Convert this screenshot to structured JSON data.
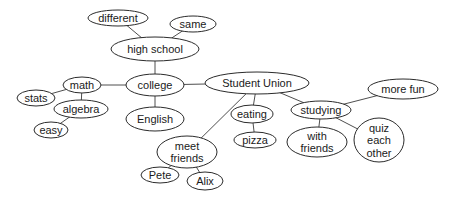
{
  "diagram": {
    "type": "concept-map",
    "colors": {
      "background": "#ffffff",
      "stroke": "#2b2b2b",
      "text": "#1a1a1a"
    },
    "nodes": [
      {
        "id": "different",
        "lines": [
          "different"
        ],
        "cx": 118,
        "cy": 18,
        "rx": 30,
        "ry": 8,
        "fs": 11
      },
      {
        "id": "same",
        "lines": [
          "same"
        ],
        "cx": 193,
        "cy": 24,
        "rx": 23,
        "ry": 8,
        "fs": 11
      },
      {
        "id": "high-school",
        "lines": [
          "high school"
        ],
        "cx": 155,
        "cy": 49,
        "rx": 44,
        "ry": 12,
        "fs": 12
      },
      {
        "id": "math",
        "lines": [
          "math"
        ],
        "cx": 82,
        "cy": 85,
        "rx": 19,
        "ry": 8,
        "fs": 11
      },
      {
        "id": "stats",
        "lines": [
          "stats"
        ],
        "cx": 36,
        "cy": 98,
        "rx": 19,
        "ry": 8,
        "fs": 11
      },
      {
        "id": "algebra",
        "lines": [
          "algebra"
        ],
        "cx": 81,
        "cy": 109,
        "rx": 27,
        "ry": 9,
        "fs": 11
      },
      {
        "id": "easy",
        "lines": [
          "easy"
        ],
        "cx": 51,
        "cy": 130,
        "rx": 17,
        "ry": 8,
        "fs": 11
      },
      {
        "id": "college",
        "lines": [
          "college"
        ],
        "cx": 155,
        "cy": 85,
        "rx": 29,
        "ry": 11,
        "fs": 12
      },
      {
        "id": "english",
        "lines": [
          "English"
        ],
        "cx": 155,
        "cy": 119,
        "rx": 29,
        "ry": 12,
        "fs": 12
      },
      {
        "id": "student-union",
        "lines": [
          "Student Union"
        ],
        "cx": 257,
        "cy": 83,
        "rx": 52,
        "ry": 11,
        "fs": 12
      },
      {
        "id": "eating",
        "lines": [
          "eating"
        ],
        "cx": 252,
        "cy": 114,
        "rx": 21,
        "ry": 9,
        "fs": 11
      },
      {
        "id": "pizza",
        "lines": [
          "pizza"
        ],
        "cx": 255,
        "cy": 140,
        "rx": 21,
        "ry": 8,
        "fs": 11
      },
      {
        "id": "studying",
        "lines": [
          "studying"
        ],
        "cx": 321,
        "cy": 110,
        "rx": 30,
        "ry": 9,
        "fs": 11
      },
      {
        "id": "more-fun",
        "lines": [
          "more fun"
        ],
        "cx": 403,
        "cy": 89,
        "rx": 35,
        "ry": 10,
        "fs": 11
      },
      {
        "id": "with-friends",
        "lines": [
          "with",
          "friends"
        ],
        "cx": 317,
        "cy": 142,
        "rx": 30,
        "ry": 15,
        "fs": 11
      },
      {
        "id": "quiz",
        "lines": [
          "quiz",
          "each",
          "other"
        ],
        "cx": 379,
        "cy": 140,
        "rx": 25,
        "ry": 22,
        "fs": 11
      },
      {
        "id": "meet-friends",
        "lines": [
          "meet",
          "friends"
        ],
        "cx": 187,
        "cy": 152,
        "rx": 30,
        "ry": 16,
        "fs": 11
      },
      {
        "id": "pete",
        "lines": [
          "Pete"
        ],
        "cx": 160,
        "cy": 175,
        "rx": 19,
        "ry": 8,
        "fs": 11
      },
      {
        "id": "alix",
        "lines": [
          "Alix"
        ],
        "cx": 205,
        "cy": 181,
        "rx": 18,
        "ry": 9,
        "fs": 11
      }
    ],
    "edges": [
      [
        "different",
        "high-school"
      ],
      [
        "same",
        "high-school"
      ],
      [
        "high-school",
        "college"
      ],
      [
        "college",
        "math"
      ],
      [
        "college",
        "english"
      ],
      [
        "college",
        "student-union"
      ],
      [
        "math",
        "stats"
      ],
      [
        "math",
        "algebra"
      ],
      [
        "algebra",
        "easy"
      ],
      [
        "student-union",
        "meet-friends"
      ],
      [
        "student-union",
        "eating"
      ],
      [
        "student-union",
        "studying"
      ],
      [
        "eating",
        "pizza"
      ],
      [
        "studying",
        "more-fun"
      ],
      [
        "studying",
        "with-friends"
      ],
      [
        "studying",
        "quiz"
      ],
      [
        "meet-friends",
        "pete"
      ],
      [
        "meet-friends",
        "alix"
      ]
    ]
  }
}
